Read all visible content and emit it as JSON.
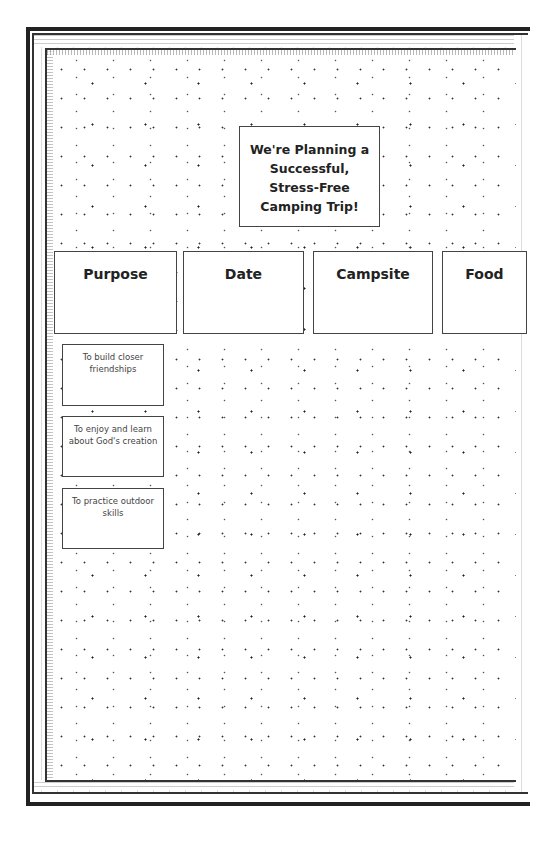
{
  "board": {
    "title_lines": [
      "We're Planning a",
      "Successful,",
      "Stress-Free",
      "Camping Trip!"
    ],
    "categories": [
      {
        "label": "Purpose"
      },
      {
        "label": "Date"
      },
      {
        "label": "Campsite"
      },
      {
        "label": "Food"
      }
    ],
    "purpose_items": [
      {
        "text": "To build closer friendships"
      },
      {
        "text": "To enjoy and learn about God's creation"
      },
      {
        "text": "To practice outdoor skills"
      }
    ]
  },
  "colors": {
    "frame": "#222222",
    "card_border": "#444444",
    "background": "#ffffff"
  }
}
